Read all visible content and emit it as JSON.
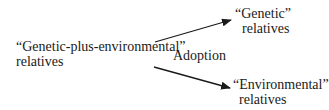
{
  "diagram": {
    "source": {
      "line1": "“Genetic-plus-environmental”",
      "line2": "relatives"
    },
    "targets": [
      {
        "line1": "“Genetic”",
        "line2": "relatives"
      },
      {
        "line1": "“Environmental”",
        "line2": "relatives"
      }
    ],
    "edge_label": "Adoption",
    "edges": [
      {
        "from": "source",
        "to": "targets.0"
      },
      {
        "from": "source",
        "to": "targets.1"
      }
    ],
    "colors": {
      "line": "#1a1a1a",
      "text": "#1a1a1a",
      "background": "#ffffff"
    }
  }
}
